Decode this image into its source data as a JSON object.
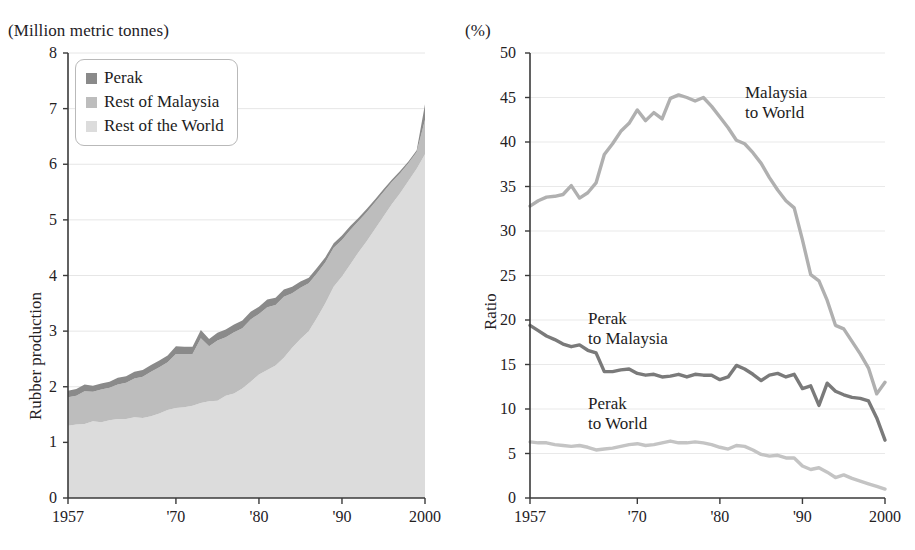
{
  "figure": {
    "panels": [
      {
        "id": "production",
        "unit_label": "(Million metric tonnes)",
        "y_axis_title": "Rubber production",
        "legend": [
          {
            "label": "Perak",
            "color": "#8a8a8a"
          },
          {
            "label": "Rest of Malaysia",
            "color": "#bdbdbd"
          },
          {
            "label": "Rest of the World",
            "color": "#dcdcdc"
          }
        ]
      },
      {
        "id": "ratio",
        "unit_label": "(%)",
        "y_axis_title": "Ratio",
        "annotations": [
          {
            "name": "malaysia-to-world-label",
            "line1": "Malaysia",
            "line2": "to World"
          },
          {
            "name": "perak-to-malaysia-label",
            "line1": "Perak",
            "line2": "to Malaysia"
          },
          {
            "name": "perak-to-world-label",
            "line1": "Perak",
            "line2": "to World"
          }
        ]
      }
    ]
  },
  "chart_data": [
    {
      "type": "area",
      "id": "rubber-production",
      "title": "",
      "subtitle": "(Million metric tonnes)",
      "xlabel": "",
      "ylabel": "Rubber production",
      "xlim": [
        1957,
        2000
      ],
      "ylim": [
        0,
        8
      ],
      "yticks": [
        0,
        1,
        2,
        3,
        4,
        5,
        6,
        7,
        8
      ],
      "xticks": [
        1957,
        1970,
        1980,
        1990,
        2000
      ],
      "xticklabels": [
        "1957",
        "'70",
        "'80",
        "'90",
        "2000"
      ],
      "grid": "horizontal-light",
      "legend": [
        "Perak",
        "Rest of Malaysia",
        "Rest of the World"
      ],
      "legend_position": "upper-left-inside",
      "stacked": true,
      "stack_order_bottom_to_top": [
        "Rest of the World",
        "Rest of Malaysia",
        "Perak"
      ],
      "x": [
        1957,
        1958,
        1959,
        1960,
        1961,
        1962,
        1963,
        1964,
        1965,
        1966,
        1967,
        1968,
        1969,
        1970,
        1971,
        1972,
        1973,
        1974,
        1975,
        1976,
        1977,
        1978,
        1979,
        1980,
        1981,
        1982,
        1983,
        1984,
        1985,
        1986,
        1987,
        1988,
        1989,
        1990,
        1991,
        1992,
        1993,
        1994,
        1995,
        1996,
        1997,
        1998,
        1999,
        2000
      ],
      "series": [
        {
          "name": "Rest of the World",
          "color": "#dcdcdc",
          "values": [
            1.3,
            1.32,
            1.33,
            1.38,
            1.36,
            1.4,
            1.42,
            1.42,
            1.45,
            1.44,
            1.47,
            1.52,
            1.58,
            1.62,
            1.63,
            1.66,
            1.71,
            1.74,
            1.75,
            1.84,
            1.88,
            1.97,
            2.09,
            2.22,
            2.3,
            2.38,
            2.52,
            2.7,
            2.86,
            3.0,
            3.24,
            3.5,
            3.8,
            3.98,
            4.2,
            4.42,
            4.62,
            4.84,
            5.06,
            5.28,
            5.48,
            5.7,
            5.92,
            6.18
          ]
        },
        {
          "name": "Rest of Malaysia",
          "color": "#bdbdbd",
          "values": [
            0.51,
            0.52,
            0.59,
            0.53,
            0.59,
            0.58,
            0.62,
            0.65,
            0.7,
            0.74,
            0.8,
            0.83,
            0.86,
            0.97,
            0.96,
            0.93,
            1.16,
            0.99,
            1.08,
            1.05,
            1.1,
            1.08,
            1.12,
            1.09,
            1.13,
            1.09,
            1.1,
            0.98,
            0.92,
            0.86,
            0.8,
            0.74,
            0.7,
            0.66,
            0.62,
            0.56,
            0.52,
            0.48,
            0.44,
            0.4,
            0.36,
            0.32,
            0.3,
            0.62
          ]
        },
        {
          "name": "Perak",
          "color": "#8a8a8a",
          "values": [
            0.12,
            0.12,
            0.12,
            0.11,
            0.11,
            0.11,
            0.12,
            0.12,
            0.12,
            0.12,
            0.12,
            0.12,
            0.12,
            0.14,
            0.13,
            0.13,
            0.15,
            0.13,
            0.14,
            0.14,
            0.14,
            0.14,
            0.14,
            0.13,
            0.14,
            0.13,
            0.13,
            0.12,
            0.11,
            0.1,
            0.1,
            0.09,
            0.08,
            0.08,
            0.07,
            0.06,
            0.06,
            0.05,
            0.05,
            0.04,
            0.04,
            0.03,
            0.03,
            0.28
          ]
        }
      ]
    },
    {
      "type": "line",
      "id": "ratios",
      "title": "",
      "subtitle": "(%)",
      "xlabel": "",
      "ylabel": "Ratio",
      "xlim": [
        1957,
        2000
      ],
      "ylim": [
        0,
        50
      ],
      "yticks": [
        0,
        5,
        10,
        15,
        20,
        25,
        30,
        35,
        40,
        45,
        50
      ],
      "xticks": [
        1957,
        1970,
        1980,
        1990,
        2000
      ],
      "xticklabels": [
        "1957",
        "'70",
        "'80",
        "'90",
        "2000"
      ],
      "grid": "horizontal-light",
      "legend_position": "inline-annotations",
      "x": [
        1957,
        1958,
        1959,
        1960,
        1961,
        1962,
        1963,
        1964,
        1965,
        1966,
        1967,
        1968,
        1969,
        1970,
        1971,
        1972,
        1973,
        1974,
        1975,
        1976,
        1977,
        1978,
        1979,
        1980,
        1981,
        1982,
        1983,
        1984,
        1985,
        1986,
        1987,
        1988,
        1989,
        1990,
        1991,
        1992,
        1993,
        1994,
        1995,
        1996,
        1997,
        1998,
        1999,
        2000
      ],
      "series": [
        {
          "name": "Malaysia to World",
          "color": "#b0b0b0",
          "values": [
            32.8,
            33.4,
            33.8,
            33.9,
            34.1,
            35.1,
            33.7,
            34.3,
            35.4,
            38.6,
            39.8,
            41.2,
            42.1,
            43.6,
            42.4,
            43.3,
            42.6,
            44.9,
            45.3,
            45.0,
            44.6,
            45.0,
            44.0,
            42.8,
            41.6,
            40.2,
            39.8,
            38.8,
            37.6,
            36.0,
            34.6,
            33.4,
            32.6,
            29.0,
            25.1,
            24.4,
            22.2,
            19.4,
            19.0,
            17.6,
            16.2,
            14.6,
            11.7,
            13.0
          ]
        },
        {
          "name": "Perak to Malaysia",
          "color": "#7a7a7a",
          "values": [
            19.4,
            18.8,
            18.2,
            17.8,
            17.3,
            17.0,
            17.2,
            16.6,
            16.3,
            14.2,
            14.2,
            14.4,
            14.5,
            14.0,
            13.8,
            13.9,
            13.6,
            13.7,
            13.9,
            13.6,
            13.9,
            13.8,
            13.8,
            13.3,
            13.6,
            14.9,
            14.5,
            13.9,
            13.2,
            13.8,
            14.0,
            13.6,
            13.9,
            12.3,
            12.6,
            10.4,
            12.9,
            12.0,
            11.6,
            11.3,
            11.2,
            10.9,
            9.0,
            6.5
          ]
        },
        {
          "name": "Perak to World",
          "color": "#c4c4c4",
          "values": [
            6.3,
            6.2,
            6.2,
            6.0,
            5.9,
            5.8,
            5.9,
            5.7,
            5.4,
            5.5,
            5.6,
            5.8,
            6.0,
            6.1,
            5.9,
            6.0,
            6.2,
            6.4,
            6.2,
            6.2,
            6.3,
            6.2,
            6.0,
            5.7,
            5.5,
            5.9,
            5.8,
            5.4,
            4.9,
            4.7,
            4.8,
            4.5,
            4.5,
            3.6,
            3.2,
            3.4,
            2.9,
            2.3,
            2.6,
            2.2,
            1.9,
            1.6,
            1.3,
            1.0
          ]
        }
      ]
    }
  ]
}
